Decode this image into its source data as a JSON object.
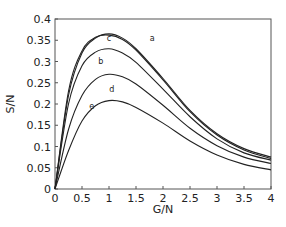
{
  "chart_data": {
    "type": "line",
    "title": "",
    "xlabel": "G/N",
    "ylabel": "S/N",
    "xlim": [
      0,
      4
    ],
    "ylim": [
      0,
      0.4
    ],
    "grid": false,
    "legend": "none (curves labeled inline a–e)",
    "xticks": [
      0,
      0.5,
      1,
      1.5,
      2,
      2.5,
      3,
      3.5,
      4
    ],
    "xtick_labels": [
      "0",
      "0.5",
      "1",
      "1.5",
      "2",
      "2.5",
      "3",
      "3.5",
      "4"
    ],
    "yticks": [
      0,
      0.05,
      0.1,
      0.15,
      0.2,
      0.25,
      0.3,
      0.35,
      0.4
    ],
    "ytick_labels": [
      "0",
      "0.05",
      "0.1",
      "0.15",
      "0.2",
      "0.25",
      "0.3",
      "0.35",
      "0.4"
    ],
    "x": [
      0,
      0.25,
      0.5,
      0.75,
      1,
      1.25,
      1.5,
      2,
      2.5,
      3,
      3.5,
      4
    ],
    "series": [
      {
        "name": "a",
        "values": [
          0,
          0.22,
          0.32,
          0.355,
          0.365,
          0.355,
          0.33,
          0.26,
          0.185,
          0.13,
          0.095,
          0.075
        ],
        "label_at": [
          1.8,
          0.355
        ]
      },
      {
        "name": "c",
        "values": [
          0,
          0.23,
          0.325,
          0.357,
          0.362,
          0.352,
          0.327,
          0.257,
          0.182,
          0.127,
          0.092,
          0.072
        ],
        "label_at": [
          1.0,
          0.355
        ]
      },
      {
        "name": "b",
        "values": [
          0,
          0.2,
          0.29,
          0.322,
          0.33,
          0.32,
          0.298,
          0.235,
          0.17,
          0.118,
          0.085,
          0.068
        ],
        "label_at": [
          0.85,
          0.302
        ]
      },
      {
        "name": "d",
        "values": [
          0,
          0.14,
          0.22,
          0.258,
          0.27,
          0.264,
          0.247,
          0.197,
          0.143,
          0.102,
          0.075,
          0.06
        ],
        "label_at": [
          1.05,
          0.235
        ]
      },
      {
        "name": "e",
        "values": [
          0,
          0.09,
          0.16,
          0.196,
          0.208,
          0.205,
          0.192,
          0.155,
          0.113,
          0.08,
          0.058,
          0.045
        ],
        "label_at": [
          0.68,
          0.195
        ]
      }
    ]
  }
}
